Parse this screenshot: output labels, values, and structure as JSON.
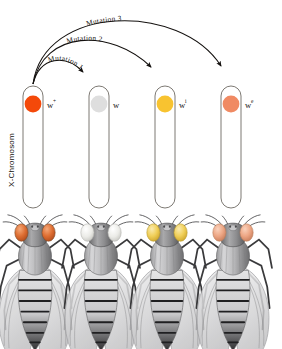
{
  "figure": {
    "axis_label": "X-Chromosom",
    "background": "#ffffff"
  },
  "chromosomes": [
    {
      "allele": "w",
      "superscript": "+",
      "dot_color": "#F4490A",
      "dot_stroke": "#e0busy",
      "eye_color": "#E2723A",
      "x": 30
    },
    {
      "allele": "w",
      "superscript": "",
      "dot_color": "#DEDEDE",
      "dot_stroke": "#cccccc",
      "eye_color": "#EDEDE8",
      "x": 95
    },
    {
      "allele": "w",
      "superscript": "i",
      "dot_color": "#F8C330",
      "dot_stroke": "#e8b520",
      "eye_color": "#F2D46A",
      "x": 161
    },
    {
      "allele": "w",
      "superscript": "e",
      "dot_color": "#F08A63",
      "dot_stroke": "#e07a53",
      "eye_color": "#EEA98A",
      "x": 227
    }
  ],
  "mutations": [
    {
      "label": "Mutation 1",
      "from": 0,
      "to": 1
    },
    {
      "label": "Mutation 2",
      "from": 0,
      "to": 2
    },
    {
      "label": "Mutation 3",
      "from": 0,
      "to": 3
    }
  ],
  "colors": {
    "chromosome_stroke": "#6e6a63",
    "arrow_stroke": "#14110f",
    "text": "#16120f",
    "fly_body_dark": "#3d3d3f",
    "fly_body_mid": "#8a8a8c",
    "fly_body_light": "#d8d8da",
    "wing": "#e9e9ea"
  }
}
